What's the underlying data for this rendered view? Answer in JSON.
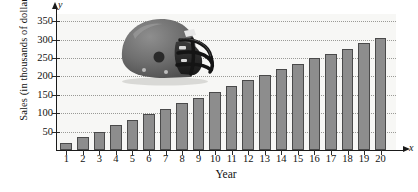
{
  "figure": {
    "y_axis_title": "Sales (in thousands of dollars)",
    "x_axis_title": "Year",
    "y_axis_symbol": "y",
    "x_axis_symbol": "x",
    "bar_fill_color": "#8d8d8d",
    "bar_edge_color": "#4a4a4a",
    "plot_background_color": "#f7f7f5",
    "gridline_color": "#9a9a96",
    "illustration": "football-helmet"
  },
  "chart_data": {
    "type": "bar",
    "title": "",
    "xlabel": "Year",
    "ylabel": "Sales (in thousands of dollars)",
    "categories": [
      "1",
      "2",
      "3",
      "4",
      "5",
      "6",
      "7",
      "8",
      "9",
      "10",
      "11",
      "12",
      "13",
      "14",
      "15",
      "16",
      "17",
      "18",
      "19",
      "20"
    ],
    "values": [
      20,
      35,
      50,
      67,
      82,
      97,
      112,
      127,
      142,
      158,
      175,
      190,
      205,
      220,
      235,
      250,
      262,
      275,
      290,
      305
    ],
    "ylim": [
      0,
      370
    ],
    "yticks": [
      50,
      100,
      150,
      200,
      250,
      300,
      350
    ],
    "ytick_labels": [
      "50",
      "100",
      "150",
      "200",
      "250",
      "300",
      "350"
    ],
    "xlim": [
      0,
      21
    ],
    "grid": true,
    "grid_axis": "y",
    "legend": null,
    "annotations": [
      "football helmet image overlay in upper-left of plot area"
    ]
  }
}
